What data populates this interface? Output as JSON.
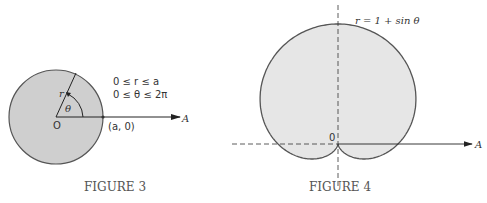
{
  "figure3": {
    "caption": "FIGURE 3",
    "constraint_r": "0 ≤ r ≤ a",
    "constraint_theta": "0 ≤ θ ≤ 2π",
    "point_label": "(a, 0)",
    "origin_label": "O",
    "axis_label": "A",
    "radius_label": "r",
    "angle_label": "θ",
    "fill_color": "#cfcfcf"
  },
  "figure4": {
    "caption": "FIGURE 4",
    "equation": "r = 1 + sin θ",
    "origin_label": "0",
    "axis_label": "A",
    "fill_color": "#e6e6e6"
  }
}
